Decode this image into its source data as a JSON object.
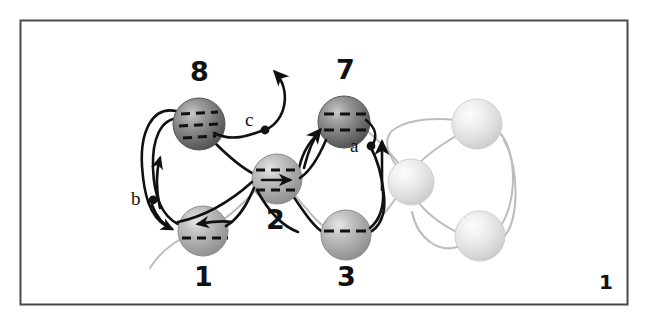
{
  "figure": {
    "caption_page_number": "1",
    "frame": {
      "x": 20,
      "y": 20,
      "width": 608,
      "height": 285,
      "border_color": "#4a4a4a"
    },
    "background_color": "#ffffff",
    "colors": {
      "strand_dark": "#111111",
      "strand_faded": "#b9b9b9",
      "sphere_dark": "#6f6f6f",
      "sphere_mid": "#9e9e9e",
      "sphere_light": "#dcdcdc",
      "label_color": "#111111"
    },
    "spheres": [
      {
        "id": "sphere-8",
        "label": "8",
        "cx": 199,
        "cy": 124,
        "r": 26,
        "shade": "dark",
        "dashes": 3,
        "label_x": 190,
        "label_y": 60
      },
      {
        "id": "sphere-7",
        "label": "7",
        "cx": 344,
        "cy": 122,
        "r": 26,
        "shade": "dark",
        "dashes": 2,
        "label_x": 336,
        "label_y": 58
      },
      {
        "id": "sphere-2",
        "label": "2",
        "cx": 277,
        "cy": 179,
        "r": 25,
        "shade": "mid",
        "dashes": 2,
        "label_x": 268,
        "label_y": 208
      },
      {
        "id": "sphere-1",
        "label": "1",
        "cx": 203,
        "cy": 231,
        "r": 25,
        "shade": "mid",
        "dashes": 1,
        "label_x": 195,
        "label_y": 265
      },
      {
        "id": "sphere-3",
        "label": "3",
        "cx": 346,
        "cy": 235,
        "r": 25,
        "shade": "mid",
        "dashes": 1,
        "label_x": 338,
        "label_y": 265
      },
      {
        "id": "sphere-right-mid",
        "label": "",
        "cx": 411,
        "cy": 182,
        "r": 23,
        "shade": "light",
        "dashes": 0
      },
      {
        "id": "sphere-right-top",
        "label": "",
        "cx": 477,
        "cy": 124,
        "r": 25,
        "shade": "light",
        "dashes": 0
      },
      {
        "id": "sphere-right-bottom",
        "label": "",
        "cx": 480,
        "cy": 236,
        "r": 25,
        "shade": "light",
        "dashes": 0
      }
    ],
    "point_labels": [
      {
        "id": "label-a",
        "text": "a",
        "x": 352,
        "y": 142,
        "dot_x": 371,
        "dot_y": 146
      },
      {
        "id": "label-b",
        "text": "b",
        "x": 133,
        "y": 188,
        "dot_x": 153,
        "dot_y": 200
      },
      {
        "id": "label-c",
        "text": "c",
        "x": 247,
        "y": 111,
        "dot_x": 265,
        "dot_y": 130
      }
    ],
    "arrow_count": 6,
    "strand_description": "interlocking knotted tube strands threading through shaded spheres"
  }
}
